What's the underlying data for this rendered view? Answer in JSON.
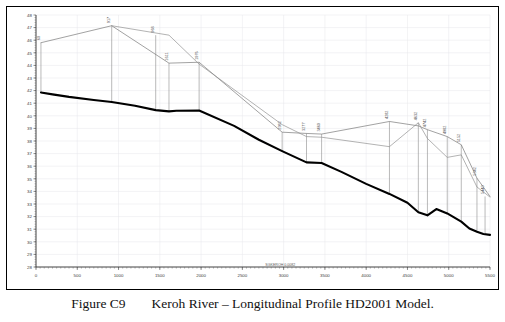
{
  "figure": {
    "caption_number": "Figure C9",
    "caption_text": "Keroh River – Longitudinal Profile HD2001 Model."
  },
  "chart_data": {
    "type": "line",
    "title": "Keroh River – Longitudinal Profile HD2001 Model",
    "xlabel": "SGKEROH 0.0082",
    "ylabel": "",
    "xlim": [
      0,
      5500
    ],
    "ylim": [
      28,
      48
    ],
    "xticks": [
      0,
      500,
      1000,
      1500,
      2000,
      2500,
      3000,
      3500,
      4000,
      4500,
      5000,
      5500
    ],
    "xtick_labels": [
      "0",
      "500",
      "1000",
      "1500",
      "2000",
      "2500",
      "3000",
      "3500",
      "4000",
      "4500",
      "5000",
      "5500"
    ],
    "yticks": [
      28,
      29,
      30,
      31,
      32,
      33,
      34,
      35,
      36,
      37,
      38,
      39,
      40,
      41,
      42,
      43,
      44,
      45,
      46,
      47,
      48
    ],
    "ytick_labels": [
      "28",
      "29",
      "30",
      "31",
      "32",
      "33",
      "34",
      "35",
      "36",
      "37",
      "38",
      "39",
      "40",
      "41",
      "42",
      "43",
      "44",
      "45",
      "46",
      "47",
      "48"
    ],
    "grid": true,
    "legend_position": "none",
    "series": [
      {
        "name": "Bed Level",
        "style": "thick-black",
        "color": "#000000",
        "x": [
          60,
          200,
          400,
          700,
          917,
          1200,
          1450,
          1611,
          1700,
          1976,
          2400,
          2700,
          2982,
          3277,
          3460,
          3700,
          4000,
          4282,
          4500,
          4632,
          4742,
          4850,
          4982,
          5152,
          5250,
          5342,
          5420,
          5500
        ],
        "y": [
          41.85,
          41.7,
          41.5,
          41.25,
          41.1,
          40.8,
          40.45,
          40.35,
          40.4,
          40.42,
          39.2,
          38.1,
          37.2,
          36.3,
          36.25,
          35.55,
          34.6,
          33.8,
          33.1,
          32.35,
          32.1,
          32.6,
          32.25,
          31.6,
          31.05,
          30.8,
          30.62,
          30.55
        ]
      },
      {
        "name": "Water Level / Computed Profile",
        "style": "thin-grey",
        "color": "#707070",
        "x": [
          60,
          917,
          1611,
          1976,
          2982,
          3277,
          3460,
          4282,
          4632,
          4742,
          4982,
          5152,
          5342,
          5500
        ],
        "y": [
          45.8,
          47.15,
          44.18,
          44.25,
          38.7,
          38.6,
          38.55,
          39.55,
          39.2,
          38.9,
          38.35,
          37.7,
          35.05,
          33.6
        ]
      },
      {
        "name": "Energy Line / Secondary Profile",
        "style": "thin-grey",
        "color": "#8a8a8a",
        "x": [
          917,
          1611,
          1976,
          2982,
          3277,
          3460,
          4282,
          4632,
          4742,
          4982,
          5152,
          5342,
          5500
        ],
        "y": [
          47.15,
          46.4,
          44.1,
          39.3,
          38.35,
          38.3,
          37.55,
          39.45,
          38.2,
          36.7,
          36.9,
          34.35,
          33.55
        ]
      }
    ],
    "cross_sections": [
      {
        "label": "60",
        "chainage": 60,
        "top": 45.8,
        "bottom": 41.85
      },
      {
        "label": "917",
        "chainage": 917,
        "top": 47.15,
        "bottom": 41.1
      },
      {
        "label": "968",
        "chainage": 1450,
        "top": 46.4,
        "bottom": 40.45
      },
      {
        "label": "1611",
        "chainage": 1611,
        "top": 44.18,
        "bottom": 40.35
      },
      {
        "label": "1976",
        "chainage": 1976,
        "top": 44.25,
        "bottom": 40.42
      },
      {
        "label": "2982",
        "chainage": 2982,
        "top": 38.7,
        "bottom": 37.2
      },
      {
        "label": "3277",
        "chainage": 3277,
        "top": 38.6,
        "bottom": 36.3
      },
      {
        "label": "3460",
        "chainage": 3460,
        "top": 38.55,
        "bottom": 36.25
      },
      {
        "label": "4282",
        "chainage": 4282,
        "top": 39.55,
        "bottom": 33.8
      },
      {
        "label": "4632",
        "chainage": 4632,
        "top": 39.45,
        "bottom": 32.35
      },
      {
        "label": "4742",
        "chainage": 4742,
        "top": 38.9,
        "bottom": 32.1
      },
      {
        "label": "4982",
        "chainage": 4982,
        "top": 38.35,
        "bottom": 32.25
      },
      {
        "label": "5152",
        "chainage": 5152,
        "top": 37.7,
        "bottom": 31.6
      },
      {
        "label": "5342",
        "chainage": 5342,
        "top": 35.05,
        "bottom": 30.8
      },
      {
        "label": "5440",
        "chainage": 5440,
        "top": 33.6,
        "bottom": 30.6
      }
    ]
  }
}
